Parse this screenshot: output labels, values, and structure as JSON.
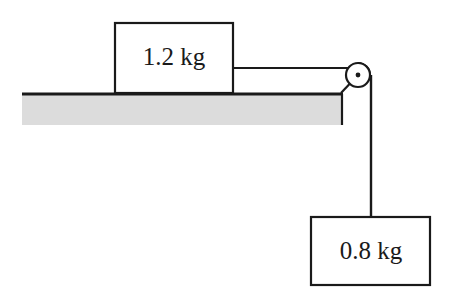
{
  "diagram": {
    "type": "pulley-system-physics-diagram",
    "background_color": "#ffffff",
    "line_color": "#1a1a1a",
    "surface_fill_color": "#dcdcdc",
    "block_fill_color": "#ffffff",
    "table_block": {
      "label": "1.2 kg",
      "x": 115,
      "y": 23,
      "width": 118,
      "height": 70
    },
    "hanging_block": {
      "label": "0.8 kg",
      "x": 311,
      "y": 217,
      "width": 119,
      "height": 68
    },
    "surface": {
      "x": 22,
      "y": 93,
      "width": 321,
      "height": 32,
      "top_edge_thickness": 3
    },
    "pulley": {
      "center_x": 358,
      "center_y": 75,
      "radius": 12,
      "hub_radius": 2.4
    },
    "string": {
      "horizontal_y": 68,
      "vertical_x": 372
    }
  }
}
